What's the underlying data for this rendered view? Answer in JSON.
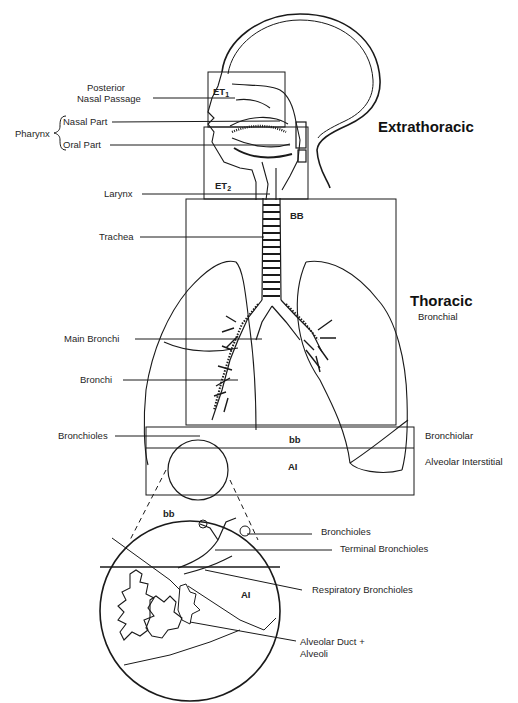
{
  "diagram": {
    "type": "anatomical respiratory tract diagram",
    "regions": {
      "extrathoracic": "Extrathoracic",
      "thoracic": "Thoracic",
      "bronchial": "Bronchial",
      "bronchiolar": "Bronchiolar",
      "alveolar_interstitial": "Alveolar Interstitial"
    },
    "box_labels": {
      "et1": "ET",
      "et1_sub": "1",
      "et2": "ET",
      "et2_sub": "2",
      "bb_upper": "BB",
      "bb_lower": "bb",
      "ai": "AI",
      "bb_zoom": "bb",
      "ai_zoom": "AI"
    },
    "left_labels": {
      "posterior_line1": "Posterior",
      "posterior_line2": "Nasal Passage",
      "pharynx": "Pharynx",
      "nasal_part": "Nasal Part",
      "oral_part": "Oral Part",
      "larynx": "Larynx",
      "trachea": "Trachea",
      "main_bronchi": "Main Bronchi",
      "bronchi": "Bronchi",
      "bronchioles": "Bronchioles"
    },
    "zoom_labels": {
      "bronchioles": "Bronchioles",
      "terminal_bronchioles": "Terminal Bronchioles",
      "respiratory_bronchioles": "Respiratory Bronchioles",
      "alveolar_line1": "Alveolar Duct +",
      "alveolar_line2": "Alveoli"
    }
  }
}
